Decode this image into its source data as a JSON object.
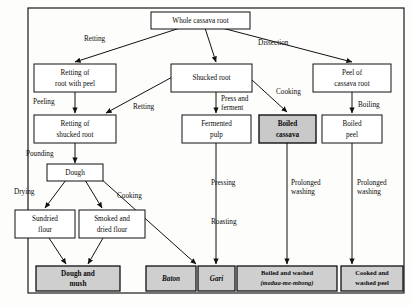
{
  "figure": {
    "border_color": "#1a1a1a",
    "shaded_fill": "#c9c9c9",
    "terminal_fill": "#cfcfcf",
    "plain_fill": "#ffffff",
    "line_color": "#111111"
  },
  "nodes": {
    "whole_cassava_root": {
      "line1": "Whole cassava root"
    },
    "retting_root_with_peel": {
      "line1": "Retting of",
      "line2": "root with peel"
    },
    "shucked_root": {
      "line1": "Shucked root"
    },
    "peel_of_cassava_root": {
      "line1": "Peel of",
      "line2": "cassava root"
    },
    "retting_shucked_root": {
      "line1": "Retting of",
      "line2": "shucked root"
    },
    "fermented_pulp": {
      "line1": "Fermented",
      "line2": "pulp"
    },
    "boiled_cassava": {
      "line1": "Boiled",
      "line2": "cassava"
    },
    "boiled_peel": {
      "line1": "Boiled",
      "line2": "peel"
    },
    "dough": {
      "line1": "Dough"
    },
    "sundried_flour": {
      "line1": "Sundried",
      "line2": "flour"
    },
    "smoked_dried_flour": {
      "line1": "Smoked and",
      "line2": "dried flour"
    },
    "dough_and_mush": {
      "line1": "Dough and",
      "line2": "mush"
    },
    "baton": {
      "line1": "Baton"
    },
    "gari": {
      "line1": "Gari"
    },
    "boiled_and_washed": {
      "line1": "Boiled and washed",
      "line2": "(medua-me-mbong)"
    },
    "cooked_and_washed_peel": {
      "line1": "Cooked and",
      "line2": "washed peel"
    }
  },
  "edge_labels": {
    "retting_top": "Retting",
    "dissection": "Dissection",
    "peeling": "Peeling",
    "retting_mid": "Retting",
    "press_and_ferment_1": "Press and",
    "press_and_ferment_2": "ferment",
    "cooking_top": "Cooking",
    "boiling": "Boiling",
    "pounding": "Pounding",
    "drying": "Drying",
    "cooking_dough": "Cooking",
    "pressing": "Pressing",
    "roasting": "Roasting",
    "prolonged_washing_a_1": "Prolonged",
    "prolonged_washing_a_2": "washing",
    "prolonged_washing_b_1": "Prolonged",
    "prolonged_washing_b_2": "washing"
  }
}
